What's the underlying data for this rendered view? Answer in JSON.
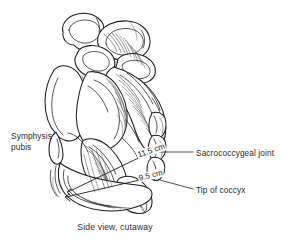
{
  "figure": {
    "title": "Side view, cutaway",
    "caption": "Side view, cutaway",
    "background_color": "#ffffff",
    "ink_color": "#1f1f1f",
    "text_color": "#2b2b2b"
  },
  "labels": {
    "symphysis_pubis": "Symphysis\npubis",
    "sacrococcygeal_joint": "Sacrococcygeal joint",
    "tip_of_coccyx": "Tip of coccyx"
  },
  "measurements": {
    "diagonal_conjugate": "11.5 cm",
    "obstetric_outlet": "9.5 cm"
  }
}
